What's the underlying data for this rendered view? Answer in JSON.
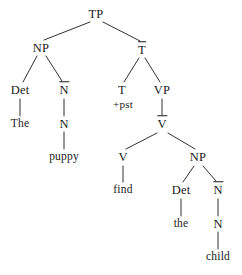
{
  "figure": {
    "kind": "syntax-tree",
    "notation": "X-bar",
    "sentence": "The puppy find the child",
    "width": 242,
    "height": 275,
    "background": "#ffffff",
    "ink": "#1a1a1a"
  },
  "nodes": [
    {
      "id": "tp",
      "label": "TP",
      "type": "category",
      "bar": false,
      "x": 96,
      "y": 14
    },
    {
      "id": "np1",
      "label": "NP",
      "type": "category",
      "bar": false,
      "x": 41,
      "y": 48
    },
    {
      "id": "tbar",
      "label": "T",
      "type": "category",
      "bar": true,
      "x": 142,
      "y": 50
    },
    {
      "id": "det1",
      "label": "Det",
      "type": "category",
      "bar": false,
      "x": 20,
      "y": 90
    },
    {
      "id": "nbar1",
      "label": "N",
      "type": "category",
      "bar": true,
      "x": 64,
      "y": 90
    },
    {
      "id": "t",
      "label": "T",
      "type": "category",
      "bar": false,
      "x": 122,
      "y": 90
    },
    {
      "id": "vp",
      "label": "VP",
      "type": "category",
      "bar": false,
      "x": 162,
      "y": 90
    },
    {
      "id": "pst",
      "label": "+pst",
      "type": "feature",
      "bar": false,
      "x": 123,
      "y": 104
    },
    {
      "id": "the1",
      "label": "The",
      "type": "leaf",
      "bar": false,
      "x": 20,
      "y": 124
    },
    {
      "id": "n1",
      "label": "N",
      "type": "category",
      "bar": false,
      "x": 64,
      "y": 124
    },
    {
      "id": "vbar",
      "label": "V",
      "type": "category",
      "bar": true,
      "x": 162,
      "y": 124
    },
    {
      "id": "puppy",
      "label": "puppy",
      "type": "leaf",
      "bar": false,
      "x": 64,
      "y": 157
    },
    {
      "id": "v",
      "label": "V",
      "type": "category",
      "bar": false,
      "x": 123,
      "y": 157
    },
    {
      "id": "np2",
      "label": "NP",
      "type": "category",
      "bar": false,
      "x": 198,
      "y": 157
    },
    {
      "id": "find",
      "label": "find",
      "type": "leaf",
      "bar": false,
      "x": 123,
      "y": 190
    },
    {
      "id": "det2",
      "label": "Det",
      "type": "category",
      "bar": false,
      "x": 181,
      "y": 190
    },
    {
      "id": "nbar2",
      "label": "N",
      "type": "category",
      "bar": true,
      "x": 218,
      "y": 190
    },
    {
      "id": "the2",
      "label": "the",
      "type": "leaf",
      "bar": false,
      "x": 181,
      "y": 224
    },
    {
      "id": "n2",
      "label": "N",
      "type": "category",
      "bar": false,
      "x": 218,
      "y": 224
    },
    {
      "id": "child",
      "label": "child",
      "type": "leaf",
      "bar": false,
      "x": 218,
      "y": 257
    }
  ],
  "edges": [
    {
      "from": "tp",
      "to": "np1",
      "x1": 90,
      "y1": 22,
      "x2": 44,
      "y2": 40
    },
    {
      "from": "tp",
      "to": "tbar",
      "x1": 103,
      "y1": 22,
      "x2": 140,
      "y2": 41
    },
    {
      "from": "np1",
      "to": "det1",
      "x1": 37,
      "y1": 56,
      "x2": 23,
      "y2": 82
    },
    {
      "from": "np1",
      "to": "nbar1",
      "x1": 46,
      "y1": 56,
      "x2": 62,
      "y2": 81
    },
    {
      "from": "det1",
      "to": "the1",
      "x1": 20,
      "y1": 99,
      "x2": 20,
      "y2": 116
    },
    {
      "from": "nbar1",
      "to": "n1",
      "x1": 64,
      "y1": 99,
      "x2": 64,
      "y2": 116
    },
    {
      "from": "n1",
      "to": "puppy",
      "x1": 64,
      "y1": 132,
      "x2": 64,
      "y2": 149
    },
    {
      "from": "tbar",
      "to": "t",
      "x1": 139,
      "y1": 58,
      "x2": 124,
      "y2": 82
    },
    {
      "from": "tbar",
      "to": "vp",
      "x1": 145,
      "y1": 58,
      "x2": 160,
      "y2": 82
    },
    {
      "from": "vp",
      "to": "vbar",
      "x1": 162,
      "y1": 99,
      "x2": 162,
      "y2": 115
    },
    {
      "from": "vbar",
      "to": "v",
      "x1": 157,
      "y1": 133,
      "x2": 126,
      "y2": 149
    },
    {
      "from": "vbar",
      "to": "np2",
      "x1": 168,
      "y1": 133,
      "x2": 195,
      "y2": 149
    },
    {
      "from": "v",
      "to": "find",
      "x1": 123,
      "y1": 166,
      "x2": 123,
      "y2": 182
    },
    {
      "from": "np2",
      "to": "det2",
      "x1": 194,
      "y1": 166,
      "x2": 183,
      "y2": 182
    },
    {
      "from": "np2",
      "to": "nbar2",
      "x1": 203,
      "y1": 166,
      "x2": 216,
      "y2": 181
    },
    {
      "from": "det2",
      "to": "the2",
      "x1": 181,
      "y1": 199,
      "x2": 181,
      "y2": 216
    },
    {
      "from": "nbar2",
      "to": "n2",
      "x1": 218,
      "y1": 199,
      "x2": 218,
      "y2": 216
    },
    {
      "from": "n2",
      "to": "child",
      "x1": 218,
      "y1": 232,
      "x2": 218,
      "y2": 249
    }
  ]
}
